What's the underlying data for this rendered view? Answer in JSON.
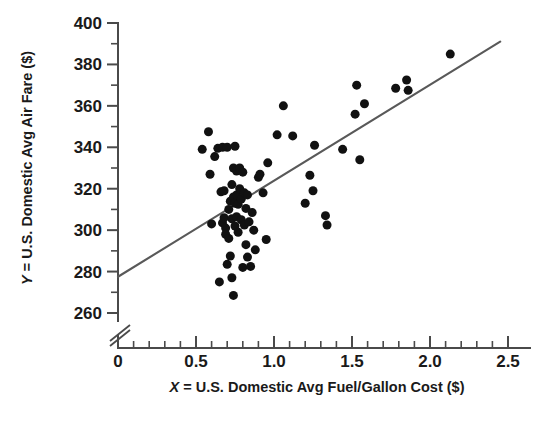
{
  "chart_data": {
    "type": "scatter",
    "title": "",
    "subtitle": "",
    "xlabel": "X = U.S. Domestic Avg Fuel/Gallon Cost ($)",
    "ylabel": "Y = U.S. Domestic Avg Air Fare ($)",
    "xlabel_var": "X",
    "xlabel_rest": " = U.S. Domestic Avg Fuel/Gallon Cost ($)",
    "ylabel_var": "Y",
    "ylabel_rest": " = U.S. Domestic Avg Air Fare ($)",
    "xlim": [
      0,
      2.5
    ],
    "ylim": [
      260,
      400
    ],
    "y_axis_break": true,
    "y_axis_break_note": "axis broken below 260",
    "grid": false,
    "legend": "none",
    "xticks": [
      0,
      0.5,
      1.0,
      1.5,
      2.0,
      2.5
    ],
    "xtick_labels": [
      "0",
      "0.5",
      "1.0",
      "1.5",
      "2.0",
      "2.5"
    ],
    "xtick_minor_step": 0.1,
    "yticks": [
      260,
      280,
      300,
      320,
      340,
      360,
      380,
      400
    ],
    "ytick_labels": [
      "260",
      "280",
      "300",
      "320",
      "340",
      "360",
      "380",
      "400"
    ],
    "ytick_minor_step": 10,
    "marker": "filled-circle",
    "marker_color": "#111111",
    "marker_size_px": 9,
    "trendline": {
      "type": "linear-regression",
      "color": "#595959",
      "x_start": 0.0,
      "y_start": 277.5,
      "x_end": 2.45,
      "y_end": 391.0,
      "slope": 46.3,
      "intercept": 277.5
    },
    "points": [
      [
        0.54,
        339.0
      ],
      [
        0.58,
        347.5
      ],
      [
        0.59,
        327.0
      ],
      [
        0.6,
        303.0
      ],
      [
        0.62,
        335.5
      ],
      [
        0.64,
        339.5
      ],
      [
        0.65,
        275.0
      ],
      [
        0.66,
        318.5
      ],
      [
        0.67,
        303.5
      ],
      [
        0.67,
        340.0
      ],
      [
        0.68,
        319.0
      ],
      [
        0.68,
        306.0
      ],
      [
        0.69,
        301.0
      ],
      [
        0.69,
        298.0
      ],
      [
        0.7,
        283.5
      ],
      [
        0.7,
        340.0
      ],
      [
        0.71,
        296.0
      ],
      [
        0.71,
        310.0
      ],
      [
        0.72,
        287.5
      ],
      [
        0.72,
        314.0
      ],
      [
        0.73,
        322.0
      ],
      [
        0.73,
        305.5
      ],
      [
        0.73,
        277.0
      ],
      [
        0.74,
        268.5
      ],
      [
        0.74,
        316.0
      ],
      [
        0.74,
        330.0
      ],
      [
        0.75,
        313.0
      ],
      [
        0.75,
        302.0
      ],
      [
        0.75,
        340.5
      ],
      [
        0.76,
        317.0
      ],
      [
        0.76,
        306.5
      ],
      [
        0.76,
        328.5
      ],
      [
        0.77,
        312.5
      ],
      [
        0.77,
        299.0
      ],
      [
        0.78,
        320.0
      ],
      [
        0.78,
        330.0
      ],
      [
        0.79,
        315.0
      ],
      [
        0.79,
        305.0
      ],
      [
        0.8,
        328.0
      ],
      [
        0.8,
        282.0
      ],
      [
        0.81,
        318.0
      ],
      [
        0.81,
        302.5
      ],
      [
        0.82,
        310.5
      ],
      [
        0.82,
        293.0
      ],
      [
        0.83,
        317.0
      ],
      [
        0.83,
        287.0
      ],
      [
        0.84,
        304.0
      ],
      [
        0.85,
        282.5
      ],
      [
        0.86,
        308.5
      ],
      [
        0.87,
        300.0
      ],
      [
        0.88,
        290.5
      ],
      [
        0.9,
        325.5
      ],
      [
        0.91,
        327.0
      ],
      [
        0.93,
        318.0
      ],
      [
        0.95,
        295.5
      ],
      [
        0.96,
        332.5
      ],
      [
        1.02,
        346.0
      ],
      [
        1.06,
        360.0
      ],
      [
        1.12,
        345.5
      ],
      [
        1.2,
        313.0
      ],
      [
        1.23,
        326.5
      ],
      [
        1.25,
        319.0
      ],
      [
        1.26,
        341.0
      ],
      [
        1.33,
        307.0
      ],
      [
        1.34,
        302.5
      ],
      [
        1.44,
        339.0
      ],
      [
        1.52,
        356.0
      ],
      [
        1.53,
        370.0
      ],
      [
        1.55,
        334.0
      ],
      [
        1.58,
        361.0
      ],
      [
        1.78,
        368.5
      ],
      [
        1.85,
        372.5
      ],
      [
        1.86,
        367.5
      ],
      [
        2.13,
        385.0
      ]
    ],
    "point_count": 74
  },
  "figure": {
    "background_color": "#ffffff",
    "axis_color": "#4a4a4a",
    "text_color": "#1a1a1a"
  }
}
